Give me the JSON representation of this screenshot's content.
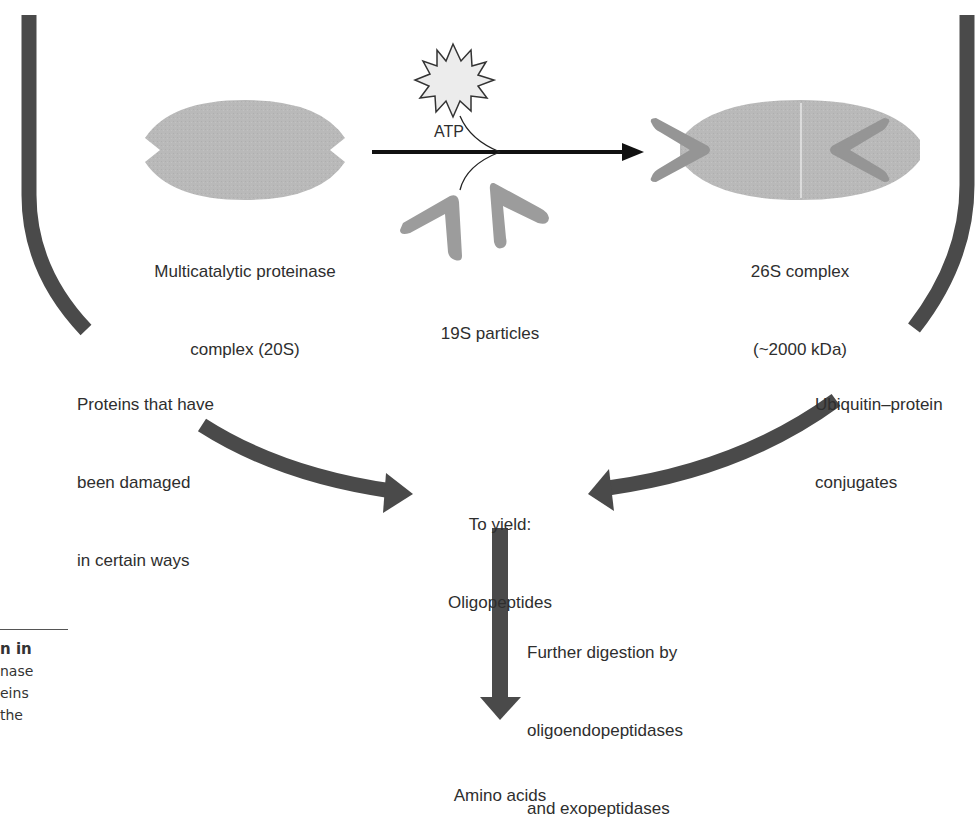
{
  "diagram": {
    "colors": {
      "thick_arrow": "#4a4a4a",
      "complex_fill": "#b8b8b8",
      "cap_fill": "#9a9a9a",
      "atp_fill": "#e8e8e8",
      "line": "#111111",
      "text": "#2e2e2e"
    },
    "nodes": {
      "proteasome_20s": {
        "line1": "Multicatalytic proteinase",
        "line2": "complex (20S)"
      },
      "atp": {
        "label": "ATP"
      },
      "particles_19s": {
        "label": "19S particles"
      },
      "complex_26s": {
        "line1": "26S complex",
        "line2": "(~2000 kDa)"
      },
      "damaged_proteins": {
        "line1": "Proteins that have",
        "line2": "been damaged",
        "line3": "in certain ways"
      },
      "ubiquitin_conjugates": {
        "line1": "Ubiquitin–protein",
        "line2": "conjugates"
      },
      "oligopeptides": {
        "line1": "To yield:",
        "line2": "Oligopeptides"
      },
      "further_digestion": {
        "line1": "Further digestion by",
        "line2": "oligoendopeptidases",
        "line3": "and exopeptidases"
      },
      "amino_acids": {
        "label": "Amino acids"
      }
    },
    "edges": [
      {
        "from": "proteasome_20s",
        "to": "complex_26s",
        "via": [
          "atp",
          "particles_19s"
        ]
      },
      {
        "from": "damaged_proteins",
        "to": "oligopeptides"
      },
      {
        "from": "ubiquitin_conjugates",
        "to": "oligopeptides"
      },
      {
        "from": "oligopeptides",
        "to": "amino_acids",
        "label": "further_digestion"
      }
    ]
  },
  "caption_fragment": {
    "line1": "n in",
    "line2": "nase",
    "line3": "eins",
    "line4": "the"
  }
}
